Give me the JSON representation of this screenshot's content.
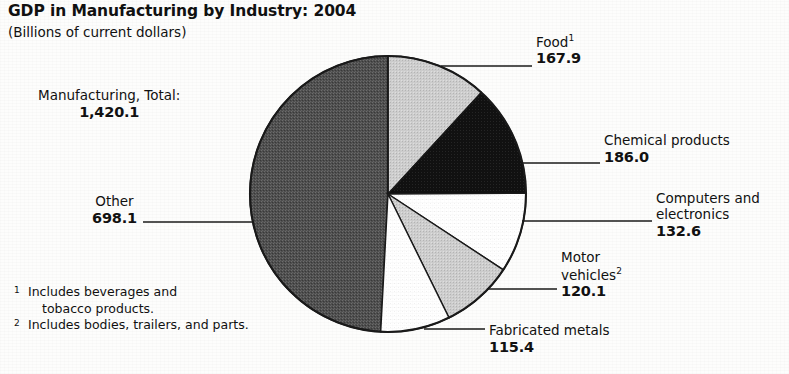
{
  "header": {
    "title": "GDP in Manufacturing by Industry: 2004",
    "subtitle": "(Billions of current dollars)"
  },
  "chart_data": {
    "type": "pie",
    "title": "GDP in Manufacturing by Industry: 2004",
    "subtitle": "(Billions of current dollars)",
    "units": "Billions of current dollars",
    "total_label": "Manufacturing, Total:",
    "total_value": "1,420.1",
    "total": 1420.1,
    "legend": "none",
    "grid": false,
    "start_angle_deg": 0,
    "direction": "clockwise",
    "categories": [
      "Food",
      "Chemical products",
      "Computers and electronics",
      "Motor vehicles",
      "Fabricated metals",
      "Other"
    ],
    "values": [
      167.9,
      186.0,
      132.6,
      120.1,
      115.4,
      698.1
    ],
    "slices": [
      {
        "name": "Food",
        "label": "Food",
        "footnote_mark": "1",
        "value": 167.9,
        "value_label": "167.9",
        "fill": "#cdcdcd",
        "pattern": "light-gray-halftone",
        "start_deg": 0.0,
        "end_deg": 42.6
      },
      {
        "name": "Chemical products",
        "label": "Chemical products",
        "footnote_mark": "",
        "value": 186.0,
        "value_label": "186.0",
        "fill": "#101010",
        "pattern": "solid-black",
        "start_deg": 42.6,
        "end_deg": 89.7
      },
      {
        "name": "Computers and electronics",
        "label": "Computers and\nelectronics",
        "label_line1": "Computers and",
        "label_line2": "electronics",
        "footnote_mark": "",
        "value": 132.6,
        "value_label": "132.6",
        "fill": "#ffffff",
        "pattern": "white",
        "start_deg": 89.7,
        "end_deg": 123.3
      },
      {
        "name": "Motor vehicles",
        "label": "Motor\nvehicles",
        "label_line1": "Motor",
        "label_line2": "vehicles",
        "footnote_mark": "2",
        "value": 120.1,
        "value_label": "120.1",
        "fill": "#c4c4c4",
        "pattern": "light-gray-halftone",
        "start_deg": 123.3,
        "end_deg": 153.7
      },
      {
        "name": "Fabricated metals",
        "label": "Fabricated metals",
        "footnote_mark": "",
        "value": 115.4,
        "value_label": "115.4",
        "fill": "#ffffff",
        "pattern": "white",
        "start_deg": 153.7,
        "end_deg": 183.0
      },
      {
        "name": "Other",
        "label": "Other",
        "footnote_mark": "",
        "value": 698.1,
        "value_label": "698.1",
        "fill": "#555555",
        "pattern": "dark-gray-halftone",
        "start_deg": 183.0,
        "end_deg": 360.0
      }
    ]
  },
  "footnotes": [
    {
      "mark": "1",
      "text": "Includes beverages and",
      "text_line2": "tobacco products."
    },
    {
      "mark": "2",
      "text": "Includes bodies, trailers, and parts.",
      "text_line2": ""
    }
  ],
  "colors": {
    "ink": "#111111",
    "paper": "#fdfdfc",
    "slice_black": "#101010",
    "slice_dark_gray": "#555555",
    "slice_light_gray": "#cdcdcd",
    "slice_white": "#ffffff"
  }
}
